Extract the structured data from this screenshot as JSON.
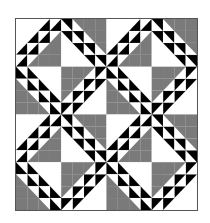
{
  "image": {
    "subject": "quilt-pattern",
    "description": "2x2 repeat of a diagonal-band patchwork block with black/white half-square triangles and gray/white corners"
  },
  "colors": {
    "white": "#ffffff",
    "black": "#000000",
    "gray": "#7a7a7a",
    "border": "#555555"
  },
  "quilt": {
    "blocks_x": 2,
    "blocks_y": 2,
    "cells_per_quarter": 4,
    "quarters": [
      {
        "pos": "top-left",
        "diag": "slash",
        "light_corner": "top-left",
        "dark_corner": "bottom-right",
        "light": "white",
        "dark": "gray"
      },
      {
        "pos": "top-right",
        "diag": "backslash",
        "light_corner": "bottom-left",
        "dark_corner": "top-right",
        "light": "white",
        "dark": "gray"
      },
      {
        "pos": "bottom-left",
        "diag": "backslash",
        "light_corner": "top-right",
        "dark_corner": "bottom-left",
        "light": "white",
        "dark": "gray"
      },
      {
        "pos": "bottom-right",
        "diag": "slash",
        "light_corner": "bottom-right",
        "dark_corner": "top-left",
        "light": "white",
        "dark": "gray"
      }
    ]
  }
}
